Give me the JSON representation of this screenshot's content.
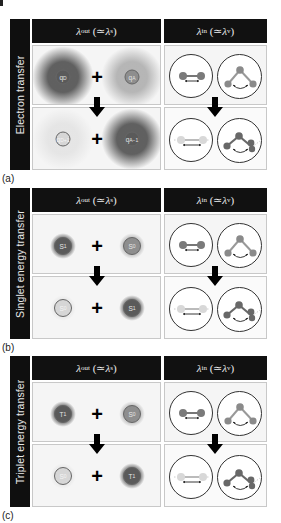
{
  "figure": {
    "column_headers": {
      "outer": {
        "symbol": "λ",
        "sub": "out",
        "approx": " (≃",
        "symbol2": "λ",
        "sub2": "s",
        "close": ")"
      },
      "inner": {
        "symbol": "λ",
        "sub": "in",
        "approx": " (≃",
        "symbol2": "λ",
        "sub2": "v",
        "close": ")"
      }
    },
    "panels": [
      {
        "id": "a",
        "label": "(a)",
        "title": "Electron transfer",
        "before": {
          "left": "qD",
          "right": "qA"
        },
        "after": {
          "left": "qD+1",
          "right": "qA−1"
        }
      },
      {
        "id": "b",
        "label": "(b)",
        "title": "Singlet energy transfer",
        "before": {
          "left": "S1",
          "right": "S0"
        },
        "after": {
          "left": "S0",
          "right": "S1"
        }
      },
      {
        "id": "c",
        "label": "(c)",
        "title": "Triplet energy transfer",
        "before": {
          "left": "T1",
          "right": "S0"
        },
        "after": {
          "left": "S0",
          "right": "T1"
        }
      }
    ],
    "plus_sign": "+",
    "colors": {
      "header_bg": "#111111",
      "dark_state": "#5a5a5a",
      "mid_state": "#8e8e8e",
      "light_state": "#d6d6d6",
      "atom": "#7a7a7a"
    }
  }
}
